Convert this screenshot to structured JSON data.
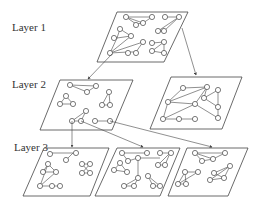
{
  "diagram": {
    "type": "hierarchical multi-layer graph",
    "labels": {
      "layer1": "Layer 1",
      "layer2": "Layer 2",
      "layer3": "Layer 3"
    },
    "layers": [
      {
        "name": "Layer 1",
        "planes": 1
      },
      {
        "name": "Layer 2",
        "planes": 2
      },
      {
        "name": "Layer 3",
        "planes": 3
      }
    ],
    "connections": [
      {
        "from": "Layer 1 plane",
        "to": "Layer 2 left plane"
      },
      {
        "from": "Layer 1 plane",
        "to": "Layer 2 right plane"
      },
      {
        "from": "Layer 2 left plane",
        "to": "Layer 3 left plane"
      },
      {
        "from": "Layer 2 left plane",
        "to": "Layer 3 middle plane"
      },
      {
        "from": "Layer 2 left plane",
        "to": "Layer 3 right plane"
      }
    ],
    "colors": {
      "stroke": "#444444",
      "background": "#ffffff",
      "node_fill": "#ffffff"
    }
  }
}
